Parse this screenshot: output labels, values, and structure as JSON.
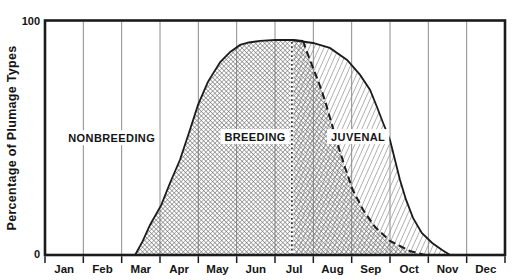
{
  "chart_data": {
    "type": "area",
    "title": "",
    "ylabel": "Percentage of Plumage Types",
    "xlabel": "",
    "x_categories": [
      "Jan",
      "Feb",
      "Mar",
      "Apr",
      "May",
      "Jun",
      "Jul",
      "Aug",
      "Sep",
      "Oct",
      "Nov",
      "Dec"
    ],
    "ylim": [
      0,
      100
    ],
    "yticks": [
      {
        "pct": 100,
        "label": "100"
      },
      {
        "pct": 0,
        "label": "0"
      }
    ],
    "grid": "vertical lines at every month boundary",
    "legend": "none",
    "series": [
      {
        "name": "BREEDING",
        "fill_style": "dense-crosshatch",
        "outline_rise_style": "solid",
        "outline_fall_style": "dashed",
        "points_rise": [
          [
            2.35,
            0
          ],
          [
            2.55,
            6
          ],
          [
            2.74,
            12.8
          ],
          [
            3.03,
            21.3
          ],
          [
            3.26,
            30.7
          ],
          [
            3.52,
            40.5
          ],
          [
            3.78,
            53.3
          ],
          [
            3.99,
            64
          ],
          [
            4.25,
            73.8
          ],
          [
            4.57,
            82.3
          ],
          [
            4.83,
            86.6
          ],
          [
            5.09,
            89.6
          ],
          [
            5.32,
            90.6
          ],
          [
            5.61,
            91.3
          ],
          [
            6.0,
            91.7
          ],
          [
            6.44,
            91.7
          ],
          [
            6.73,
            91.3
          ]
        ],
        "points_fall": [
          [
            6.73,
            91.3
          ],
          [
            6.91,
            83.2
          ],
          [
            7.12,
            74.6
          ],
          [
            7.3,
            66.1
          ],
          [
            7.49,
            55.4
          ],
          [
            7.64,
            46.9
          ],
          [
            7.83,
            37.1
          ],
          [
            8.03,
            27.7
          ],
          [
            8.3,
            19.2
          ],
          [
            8.61,
            11.9
          ],
          [
            9.0,
            6
          ],
          [
            9.52,
            1.7
          ],
          [
            9.91,
            0
          ]
        ]
      },
      {
        "name": "JUVENAL",
        "fill_style": "light-diagonal-hatch",
        "onset": {
          "month": 6.44,
          "style": "dotted-vertical",
          "pct_top": 91.7
        },
        "points_top": [
          [
            6.44,
            91.7
          ],
          [
            6.99,
            90.4
          ],
          [
            7.43,
            88.3
          ],
          [
            7.88,
            83.2
          ],
          [
            8.22,
            76.8
          ],
          [
            8.48,
            70.4
          ],
          [
            8.66,
            63.1
          ],
          [
            8.82,
            56.3
          ],
          [
            9.0,
            49
          ],
          [
            9.13,
            40.5
          ],
          [
            9.26,
            32
          ],
          [
            9.42,
            23.5
          ],
          [
            9.6,
            15.8
          ],
          [
            9.83,
            9.4
          ],
          [
            10.1,
            5.1
          ],
          [
            10.36,
            2.1
          ],
          [
            10.57,
            0
          ]
        ]
      }
    ],
    "region_labels": [
      {
        "text": "NONBREEDING",
        "month": 1.74,
        "pct": 50
      },
      {
        "text": "BREEDING",
        "month": 5.48,
        "pct": 50.5
      },
      {
        "text": "JUVENAL",
        "month": 8.17,
        "pct": 50.5
      }
    ],
    "colors": {
      "frame": "#1b1b1b",
      "grid": "#8c8c8c",
      "breeding_hatch": "#6f6f6f",
      "juvenal_hatch": "#8e8e8e",
      "background": "#ffffff",
      "text": "#141414",
      "label_box": "#ffffff"
    }
  }
}
